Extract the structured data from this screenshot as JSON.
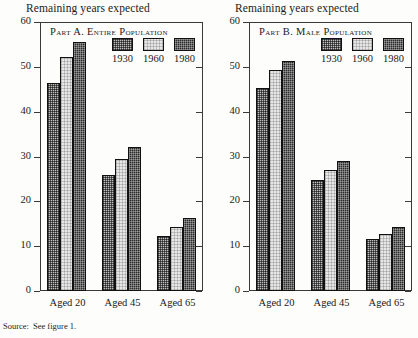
{
  "source_note": {
    "label": "Source:",
    "text": "See figure 1."
  },
  "panels": [
    {
      "id": "part-a",
      "axis_title": "Remaining years expected",
      "panel_label": "Part A. Entire Population"
    },
    {
      "id": "part-b",
      "axis_title": "Remaining years expected",
      "panel_label": "Part B. Male Population"
    }
  ],
  "chart_data": [
    {
      "type": "bar",
      "title": "Part A. Entire Population",
      "xlabel": "",
      "ylabel": "Remaining years expected",
      "ylim": [
        0,
        60
      ],
      "yticks": [
        0,
        10,
        20,
        30,
        40,
        50,
        60
      ],
      "grid": false,
      "legend_position": "top-right",
      "categories": [
        "Aged 20",
        "Aged 45",
        "Aged 65"
      ],
      "series": [
        {
          "name": "1930",
          "values": [
            46.3,
            25.8,
            12.3
          ]
        },
        {
          "name": "1960",
          "values": [
            52.2,
            29.4,
            14.3
          ]
        },
        {
          "name": "1980",
          "values": [
            55.5,
            32.2,
            16.3
          ]
        }
      ]
    },
    {
      "type": "bar",
      "title": "Part B. Male Population",
      "xlabel": "",
      "ylabel": "Remaining years expected",
      "ylim": [
        0,
        60
      ],
      "yticks": [
        0,
        10,
        20,
        30,
        40,
        50,
        60
      ],
      "grid": false,
      "legend_position": "top-right",
      "categories": [
        "Aged 20",
        "Aged 45",
        "Aged 65"
      ],
      "series": [
        {
          "name": "1930",
          "values": [
            45.2,
            24.8,
            11.7
          ]
        },
        {
          "name": "1960",
          "values": [
            49.4,
            26.9,
            12.8
          ]
        },
        {
          "name": "1980",
          "values": [
            51.4,
            29.0,
            14.2
          ]
        }
      ]
    }
  ]
}
